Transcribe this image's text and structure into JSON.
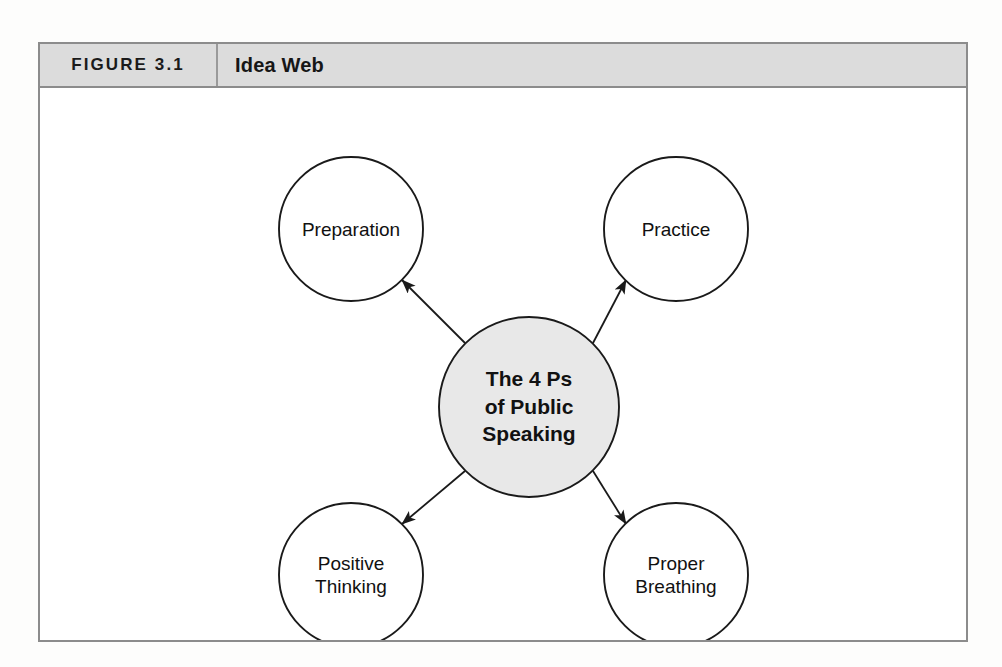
{
  "figure": {
    "number_label": "FIGURE 3.1",
    "title": "Idea Web"
  },
  "diagram": {
    "type": "idea-web",
    "center_node": {
      "id": "center",
      "lines": [
        "The 4 Ps",
        "of Public",
        "Speaking"
      ],
      "text": "The 4 Ps of Public Speaking",
      "fill_color": "#e8e8e8",
      "stroke_color": "#1a1a1a",
      "cx": 489,
      "cy": 319,
      "r": 90
    },
    "satellite_nodes": [
      {
        "id": "preparation",
        "lines": [
          "Preparation"
        ],
        "text": "Preparation",
        "fill_color": "#ffffff",
        "stroke_color": "#1a1a1a",
        "cx": 311,
        "cy": 141,
        "r": 72
      },
      {
        "id": "practice",
        "lines": [
          "Practice"
        ],
        "text": "Practice",
        "fill_color": "#ffffff",
        "stroke_color": "#1a1a1a",
        "cx": 636,
        "cy": 141,
        "r": 72
      },
      {
        "id": "positive-thinking",
        "lines": [
          "Positive",
          "Thinking"
        ],
        "text": "Positive Thinking",
        "fill_color": "#ffffff",
        "stroke_color": "#1a1a1a",
        "cx": 311,
        "cy": 487,
        "r": 72
      },
      {
        "id": "proper-breathing",
        "lines": [
          "Proper",
          "Breathing"
        ],
        "text": "Proper Breathing",
        "fill_color": "#ffffff",
        "stroke_color": "#1a1a1a",
        "cx": 636,
        "cy": 487,
        "r": 72
      }
    ],
    "connectors": [
      {
        "id": "center-to-preparation",
        "from": "center",
        "to": "preparation",
        "arrow": "to"
      },
      {
        "id": "center-to-practice",
        "from": "center",
        "to": "practice",
        "arrow": "to"
      },
      {
        "id": "center-to-positive-thinking",
        "from": "center",
        "to": "positive-thinking",
        "arrow": "to"
      },
      {
        "id": "center-to-proper-breathing",
        "from": "center",
        "to": "proper-breathing",
        "arrow": "to"
      }
    ],
    "colors": {
      "frame_border": "#8c8c8c",
      "header_background": "#dcdcdc",
      "canvas_background": "#ffffff",
      "line_color": "#1a1a1a",
      "page_background": "#fdfdfc"
    }
  }
}
